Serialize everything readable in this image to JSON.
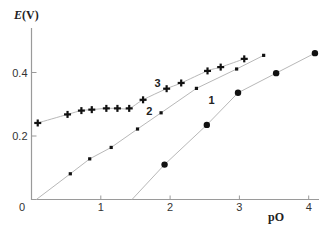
{
  "chart_data": {
    "type": "line",
    "title": "",
    "xlabel": "pO",
    "ylabel": "E(V)",
    "ylabel_italic_part": "E",
    "ylabel_rest": "(V)",
    "xlim": [
      0,
      4.15
    ],
    "ylim": [
      0,
      0.54
    ],
    "x_ticks": [
      0,
      1,
      2,
      3,
      4
    ],
    "x_tick_labels": [
      "0",
      "1",
      "2",
      "3",
      "4"
    ],
    "y_ticks": [
      0.2,
      0.4
    ],
    "y_tick_labels": [
      "0.2",
      "0.4"
    ],
    "origin_label": "0",
    "grid": false,
    "legend": "none (inline curve labels)",
    "series": [
      {
        "name": "1",
        "marker": "circle",
        "line_start": [
          1.45,
          0
        ],
        "x": [
          1.92,
          2.53,
          2.98,
          3.53,
          4.09
        ],
        "y": [
          0.11,
          0.235,
          0.336,
          0.398,
          0.461
        ],
        "label_pos": [
          2.6,
          0.3
        ]
      },
      {
        "name": "2",
        "marker": "square",
        "line_start": [
          0.07,
          0
        ],
        "x": [
          0.56,
          0.84,
          1.15,
          1.53,
          1.87,
          2.38,
          2.96,
          3.35
        ],
        "y": [
          0.081,
          0.128,
          0.164,
          0.222,
          0.273,
          0.35,
          0.411,
          0.454
        ],
        "label_pos": [
          1.7,
          0.265
        ]
      },
      {
        "name": "3",
        "marker": "plus",
        "line_start": null,
        "x": [
          0.09,
          0.52,
          0.72,
          0.87,
          1.08,
          1.24,
          1.41,
          1.61,
          1.95,
          2.16,
          2.54,
          2.73,
          3.07
        ],
        "y": [
          0.241,
          0.268,
          0.28,
          0.283,
          0.287,
          0.287,
          0.287,
          0.314,
          0.349,
          0.367,
          0.405,
          0.417,
          0.443
        ],
        "label_pos": [
          1.82,
          0.355
        ]
      }
    ]
  }
}
